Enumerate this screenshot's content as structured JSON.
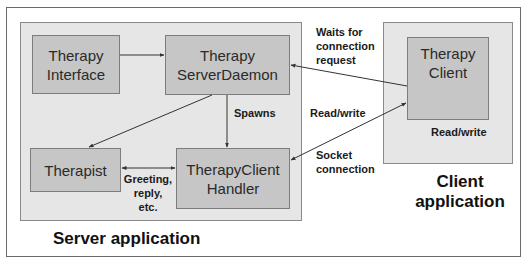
{
  "diagram": {
    "colors": {
      "frame_border": "#6a6a6a",
      "app_box_fill": "#e6e6e6",
      "node_fill": "#c6c6c6",
      "node_border": "#7d7d7d",
      "arrow": "#333333"
    },
    "containers": {
      "server": {
        "label": "Server application"
      },
      "client": {
        "label_line1": "Client",
        "label_line2": "application"
      }
    },
    "nodes": {
      "therapy_interface": {
        "line1": "Therapy",
        "line2": "Interface"
      },
      "server_daemon": {
        "line1": "Therapy",
        "line2": "ServerDaemon"
      },
      "therapist": {
        "line1": "Therapist"
      },
      "client_handler": {
        "line1": "TherapyClient",
        "line2": "Handler"
      },
      "therapy_client": {
        "line1": "Therapy",
        "line2": "Client"
      }
    },
    "edge_labels": {
      "waits": {
        "line1": "Waits for",
        "line2": "connection",
        "line3": "request"
      },
      "spawns": "Spawns",
      "read_write_mid": "Read/write",
      "read_write_client": "Read/write",
      "socket": {
        "line1": "Socket",
        "line2": "connection"
      },
      "greeting": {
        "line1": "Greeting,",
        "line2": "reply,",
        "line3": "etc."
      }
    },
    "edges": [
      {
        "from": "Therapy Interface",
        "to": "Therapy ServerDaemon",
        "direction": "forward"
      },
      {
        "from": "Therapy Client",
        "to": "Therapy ServerDaemon",
        "label": "Waits for connection request",
        "direction": "forward"
      },
      {
        "from": "Therapy ServerDaemon",
        "to": "TherapyClient Handler",
        "label": "Spawns",
        "direction": "forward"
      },
      {
        "from": "Therapy ServerDaemon",
        "to": "Therapist",
        "direction": "forward"
      },
      {
        "from": "Therapist",
        "to": "TherapyClient Handler",
        "label": "Greeting, reply, etc.",
        "direction": "both"
      },
      {
        "from": "TherapyClient Handler",
        "to": "Therapy Client",
        "label": "Read/write / Socket connection",
        "direction": "both"
      }
    ]
  }
}
